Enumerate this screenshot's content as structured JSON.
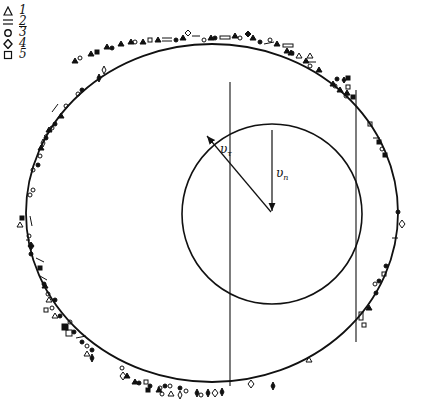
{
  "legend": [
    {
      "symbol": "triangle",
      "label": "1"
    },
    {
      "symbol": "double-dash",
      "label": "2"
    },
    {
      "symbol": "circle",
      "label": "3"
    },
    {
      "symbol": "diamond",
      "label": "4"
    },
    {
      "symbol": "square",
      "label": "5"
    }
  ],
  "vectors": {
    "tangential": {
      "label": "υ",
      "subscript": "τ"
    },
    "normal": {
      "label": "υ",
      "subscript": "n"
    }
  },
  "geometry": {
    "outer_ellipse": {
      "cx": 212,
      "cy": 213,
      "rx": 186,
      "ry": 169
    },
    "inner_circle": {
      "cx": 272,
      "cy": 214,
      "r": 90
    },
    "vertical_lines": [
      {
        "x": 230,
        "y1": 82,
        "y2": 386
      },
      {
        "x": 356,
        "y1": 90,
        "y2": 342
      }
    ]
  },
  "colors": {
    "ink": "#111111",
    "paper": "#ffffff"
  }
}
